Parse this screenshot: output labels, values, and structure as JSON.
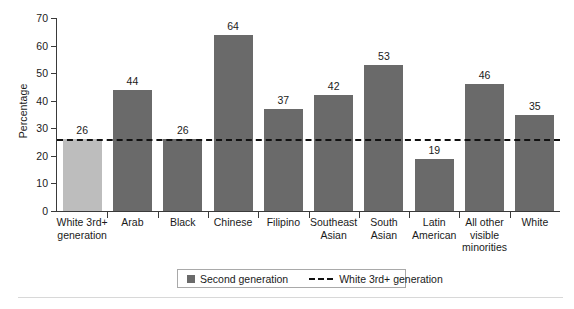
{
  "chart_data": {
    "type": "bar",
    "title": "",
    "xlabel": "",
    "ylabel": "Percentage",
    "ylim": [
      0,
      70
    ],
    "yticks": [
      0,
      10,
      20,
      30,
      40,
      50,
      60,
      70
    ],
    "grid": false,
    "categories": [
      "White 3rd+ generation",
      "Arab",
      "Black",
      "Chinese",
      "Filipino",
      "Southeast Asian",
      "South Asian",
      "Latin American",
      "All other visible minorities",
      "White"
    ],
    "category_lines": [
      [
        "White 3rd+",
        "generation"
      ],
      [
        "Arab"
      ],
      [
        "Black"
      ],
      [
        "Chinese"
      ],
      [
        "Filipino"
      ],
      [
        "Southeast",
        "Asian"
      ],
      [
        "South",
        "Asian"
      ],
      [
        "Latin",
        "American"
      ],
      [
        "All other",
        "visible",
        "minorities"
      ],
      [
        "White"
      ]
    ],
    "values": [
      26,
      44,
      26,
      64,
      37,
      42,
      53,
      19,
      46,
      35
    ],
    "value_labels": [
      "26",
      "44",
      "26",
      "64",
      "37",
      "42",
      "53",
      "19",
      "46",
      "35"
    ],
    "bar_colors": [
      "#bdbdbd",
      "#6a6a6a",
      "#6a6a6a",
      "#6a6a6a",
      "#6a6a6a",
      "#6a6a6a",
      "#6a6a6a",
      "#6a6a6a",
      "#6a6a6a",
      "#6a6a6a"
    ],
    "reference_line": {
      "label": "White 3rd+ generation",
      "value": 26,
      "style": "dashed",
      "color": "#111111"
    },
    "legend": {
      "position": "bottom-center",
      "entries": [
        {
          "label": "Second generation",
          "marker": "swatch",
          "color": "#6a6a6a"
        },
        {
          "label": "White 3rd+ generation",
          "marker": "dashed-line",
          "color": "#111111"
        }
      ]
    }
  }
}
